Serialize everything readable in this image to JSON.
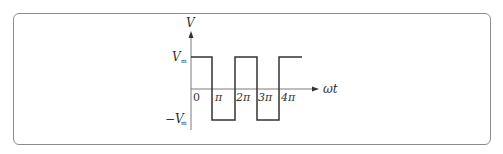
{
  "diagram": {
    "type": "square-wave-plot",
    "y_axis_label": "V",
    "x_axis_label": "ωt",
    "y_levels": {
      "positive": {
        "main": "V",
        "sub": "m"
      },
      "negative": {
        "main": "−V",
        "sub": "m"
      }
    },
    "x_ticks": [
      "0",
      "π",
      "2π",
      "3π",
      "4π"
    ],
    "colors": {
      "wave": "#333333",
      "axis": "#7a7a7a",
      "frame": "#8c8c8c"
    }
  }
}
